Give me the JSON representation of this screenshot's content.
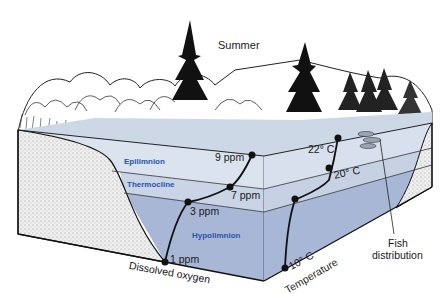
{
  "title": "Summer",
  "layers": {
    "epilimnion": "Epilimnion",
    "thermocline": "Thermocline",
    "hypolimnion": "Hypolimnion"
  },
  "profiles": {
    "oxygen": {
      "axis_label": "Dissolved oxygen",
      "points": [
        "9 ppm",
        "7 ppm",
        "3 ppm",
        "1 ppm"
      ]
    },
    "temperature": {
      "axis_label": "Temperature",
      "points": [
        "22° C",
        "20° C",
        "10° C"
      ]
    }
  },
  "callouts": {
    "fish": "Fish\ndistribution",
    "fish_line1": "Fish",
    "fish_line2": "distribution"
  },
  "colors": {
    "epilimnion": "#dbe3ee",
    "thermocline": "#c9d4e6",
    "hypolimnion": "#a9b7d6",
    "sediment": "#e6e6e6",
    "layer_label": "#2a55a8",
    "ink": "#111111"
  }
}
